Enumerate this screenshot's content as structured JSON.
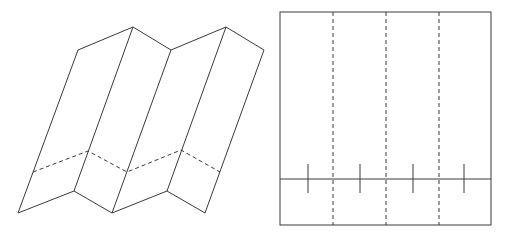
{
  "diagram": {
    "colors": {
      "stroke": "#3a3a3a",
      "background": "#ffffff"
    },
    "folded_view": {
      "description": "Zigzag (accordion) folded strip, 4 panels, shown in perspective",
      "top_points": [
        [
          78,
          50
        ],
        [
          133,
          27
        ],
        [
          171,
          50
        ],
        [
          226,
          27
        ],
        [
          264,
          50
        ]
      ],
      "bottom_points": [
        [
          18,
          213
        ],
        [
          74,
          191
        ],
        [
          112,
          213
        ],
        [
          167,
          191
        ],
        [
          205,
          213
        ]
      ],
      "dashed_fold_points": [
        [
          33,
          172
        ],
        [
          88,
          151
        ],
        [
          127,
          172
        ],
        [
          181,
          150
        ],
        [
          220,
          172
        ]
      ]
    },
    "flat_view": {
      "description": "Unfolded strip with 3 vertical dashed fold lines, 1 horizontal line and 4 tick marks",
      "rect": {
        "x": 280,
        "y": 12,
        "width": 211,
        "height": 213
      },
      "dashed_verticals_x": [
        333,
        386,
        439
      ],
      "horizontal_line_y": 179,
      "ticks": {
        "x": [
          308,
          360,
          413,
          464
        ],
        "y1": 164,
        "y2": 193
      }
    }
  }
}
